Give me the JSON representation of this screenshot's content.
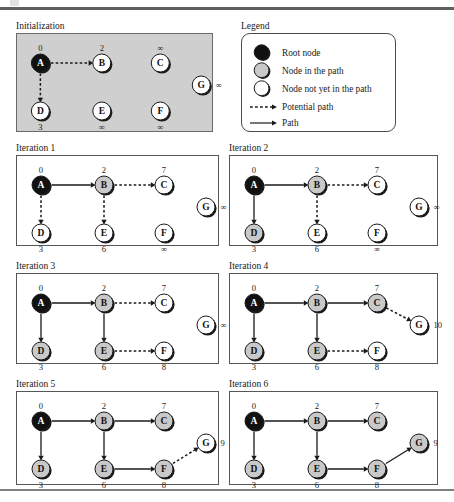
{
  "figure": {
    "corner_mark": "page-corner-artifact",
    "colors": {
      "root_node_fill": "#111111",
      "in_path_node_fill": "#c9c9c9",
      "not_in_path_node_fill": "#ffffff",
      "node_stroke": "#1a1a1a",
      "node_shadow": "#1a1a1a",
      "edge": "#1a1a1a",
      "panel_border": "#565656",
      "init_panel_fill": "#cfcfcf",
      "rule": "#5d5f61"
    }
  },
  "legend": {
    "title": "Legend",
    "items": [
      {
        "kind": "node",
        "style": "root",
        "label": "Root node"
      },
      {
        "kind": "node",
        "style": "in-path",
        "label": "Node in the path"
      },
      {
        "kind": "node",
        "style": "not-in-path",
        "label": "Node not yet in the path"
      },
      {
        "kind": "edge",
        "style": "dashed",
        "label": "Potential path"
      },
      {
        "kind": "edge",
        "style": "solid",
        "label": "Path"
      }
    ]
  },
  "chart_data": {
    "type": "diagram",
    "node_positions": {
      "A": {
        "x": 25,
        "y": 30
      },
      "B": {
        "x": 88,
        "y": 30
      },
      "C": {
        "x": 148,
        "y": 30
      },
      "G": {
        "x": 190,
        "y": 52
      },
      "D": {
        "x": 25,
        "y": 78
      },
      "E": {
        "x": 88,
        "y": 78
      },
      "F": {
        "x": 148,
        "y": 78
      }
    },
    "panels": [
      {
        "id": "initialization",
        "title": "Initialization",
        "shaded": true,
        "nodes": [
          {
            "id": "A",
            "label": "A",
            "state": "root",
            "dist": "0",
            "dist_pos": "above"
          },
          {
            "id": "B",
            "label": "B",
            "state": "not-in-path",
            "dist": "2",
            "dist_pos": "above"
          },
          {
            "id": "C",
            "label": "C",
            "state": "not-in-path",
            "dist": "∞",
            "dist_pos": "above"
          },
          {
            "id": "G",
            "label": "G",
            "state": "not-in-path",
            "dist": "∞",
            "dist_pos": "right"
          },
          {
            "id": "D",
            "label": "D",
            "state": "not-in-path",
            "dist": "3",
            "dist_pos": "below"
          },
          {
            "id": "E",
            "label": "E",
            "state": "not-in-path",
            "dist": "∞",
            "dist_pos": "below"
          },
          {
            "id": "F",
            "label": "F",
            "state": "not-in-path",
            "dist": "∞",
            "dist_pos": "below"
          }
        ],
        "edges": [
          {
            "from": "A",
            "to": "B",
            "style": "dashed"
          },
          {
            "from": "A",
            "to": "D",
            "style": "dashed"
          }
        ]
      },
      {
        "id": "iteration-1",
        "title": "Iteration 1",
        "shaded": false,
        "nodes": [
          {
            "id": "A",
            "label": "A",
            "state": "root",
            "dist": "0",
            "dist_pos": "above"
          },
          {
            "id": "B",
            "label": "B",
            "state": "in-path",
            "dist": "2",
            "dist_pos": "above"
          },
          {
            "id": "C",
            "label": "C",
            "state": "not-in-path",
            "dist": "7",
            "dist_pos": "above"
          },
          {
            "id": "G",
            "label": "G",
            "state": "not-in-path",
            "dist": "∞",
            "dist_pos": "right"
          },
          {
            "id": "D",
            "label": "D",
            "state": "not-in-path",
            "dist": "3",
            "dist_pos": "below"
          },
          {
            "id": "E",
            "label": "E",
            "state": "not-in-path",
            "dist": "6",
            "dist_pos": "below"
          },
          {
            "id": "F",
            "label": "F",
            "state": "not-in-path",
            "dist": "∞",
            "dist_pos": "below"
          }
        ],
        "edges": [
          {
            "from": "A",
            "to": "B",
            "style": "solid"
          },
          {
            "from": "A",
            "to": "D",
            "style": "dashed"
          },
          {
            "from": "B",
            "to": "C",
            "style": "dashed"
          },
          {
            "from": "B",
            "to": "E",
            "style": "dashed"
          }
        ]
      },
      {
        "id": "iteration-2",
        "title": "Iteration 2",
        "shaded": false,
        "nodes": [
          {
            "id": "A",
            "label": "A",
            "state": "root",
            "dist": "0",
            "dist_pos": "above"
          },
          {
            "id": "B",
            "label": "B",
            "state": "in-path",
            "dist": "2",
            "dist_pos": "above"
          },
          {
            "id": "C",
            "label": "C",
            "state": "not-in-path",
            "dist": "7",
            "dist_pos": "above"
          },
          {
            "id": "G",
            "label": "G",
            "state": "not-in-path",
            "dist": "∞",
            "dist_pos": "right"
          },
          {
            "id": "D",
            "label": "D",
            "state": "in-path",
            "dist": "3",
            "dist_pos": "below"
          },
          {
            "id": "E",
            "label": "E",
            "state": "not-in-path",
            "dist": "6",
            "dist_pos": "below"
          },
          {
            "id": "F",
            "label": "F",
            "state": "not-in-path",
            "dist": "∞",
            "dist_pos": "below"
          }
        ],
        "edges": [
          {
            "from": "A",
            "to": "B",
            "style": "solid"
          },
          {
            "from": "A",
            "to": "D",
            "style": "solid"
          },
          {
            "from": "B",
            "to": "C",
            "style": "dashed"
          },
          {
            "from": "B",
            "to": "E",
            "style": "dashed"
          }
        ]
      },
      {
        "id": "iteration-3",
        "title": "Iteration 3",
        "shaded": false,
        "nodes": [
          {
            "id": "A",
            "label": "A",
            "state": "root",
            "dist": "0",
            "dist_pos": "above"
          },
          {
            "id": "B",
            "label": "B",
            "state": "in-path",
            "dist": "2",
            "dist_pos": "above"
          },
          {
            "id": "C",
            "label": "C",
            "state": "not-in-path",
            "dist": "7",
            "dist_pos": "above"
          },
          {
            "id": "G",
            "label": "G",
            "state": "not-in-path",
            "dist": "∞",
            "dist_pos": "right"
          },
          {
            "id": "D",
            "label": "D",
            "state": "in-path",
            "dist": "3",
            "dist_pos": "below"
          },
          {
            "id": "E",
            "label": "E",
            "state": "in-path",
            "dist": "6",
            "dist_pos": "below"
          },
          {
            "id": "F",
            "label": "F",
            "state": "not-in-path",
            "dist": "8",
            "dist_pos": "below"
          }
        ],
        "edges": [
          {
            "from": "A",
            "to": "B",
            "style": "solid"
          },
          {
            "from": "A",
            "to": "D",
            "style": "solid"
          },
          {
            "from": "B",
            "to": "C",
            "style": "dashed"
          },
          {
            "from": "B",
            "to": "E",
            "style": "solid"
          },
          {
            "from": "E",
            "to": "F",
            "style": "dashed"
          }
        ]
      },
      {
        "id": "iteration-4",
        "title": "Iteration 4",
        "shaded": false,
        "nodes": [
          {
            "id": "A",
            "label": "A",
            "state": "root",
            "dist": "0",
            "dist_pos": "above"
          },
          {
            "id": "B",
            "label": "B",
            "state": "in-path",
            "dist": "2",
            "dist_pos": "above"
          },
          {
            "id": "C",
            "label": "C",
            "state": "in-path",
            "dist": "7",
            "dist_pos": "above"
          },
          {
            "id": "G",
            "label": "G",
            "state": "not-in-path",
            "dist": "10",
            "dist_pos": "right"
          },
          {
            "id": "D",
            "label": "D",
            "state": "in-path",
            "dist": "3",
            "dist_pos": "below"
          },
          {
            "id": "E",
            "label": "E",
            "state": "in-path",
            "dist": "6",
            "dist_pos": "below"
          },
          {
            "id": "F",
            "label": "F",
            "state": "not-in-path",
            "dist": "8",
            "dist_pos": "below"
          }
        ],
        "edges": [
          {
            "from": "A",
            "to": "B",
            "style": "solid"
          },
          {
            "from": "A",
            "to": "D",
            "style": "solid"
          },
          {
            "from": "B",
            "to": "C",
            "style": "solid"
          },
          {
            "from": "B",
            "to": "E",
            "style": "solid"
          },
          {
            "from": "E",
            "to": "F",
            "style": "dashed"
          },
          {
            "from": "C",
            "to": "G",
            "style": "dashed"
          }
        ]
      },
      {
        "id": "iteration-5",
        "title": "Iteration 5",
        "shaded": false,
        "nodes": [
          {
            "id": "A",
            "label": "A",
            "state": "root",
            "dist": "0",
            "dist_pos": "above"
          },
          {
            "id": "B",
            "label": "B",
            "state": "in-path",
            "dist": "2",
            "dist_pos": "above"
          },
          {
            "id": "C",
            "label": "C",
            "state": "in-path",
            "dist": "7",
            "dist_pos": "above"
          },
          {
            "id": "G",
            "label": "G",
            "state": "not-in-path",
            "dist": "9",
            "dist_pos": "right"
          },
          {
            "id": "D",
            "label": "D",
            "state": "in-path",
            "dist": "3",
            "dist_pos": "below"
          },
          {
            "id": "E",
            "label": "E",
            "state": "in-path",
            "dist": "6",
            "dist_pos": "below"
          },
          {
            "id": "F",
            "label": "F",
            "state": "in-path",
            "dist": "8",
            "dist_pos": "below"
          }
        ],
        "edges": [
          {
            "from": "A",
            "to": "B",
            "style": "solid"
          },
          {
            "from": "A",
            "to": "D",
            "style": "solid"
          },
          {
            "from": "B",
            "to": "C",
            "style": "solid"
          },
          {
            "from": "B",
            "to": "E",
            "style": "solid"
          },
          {
            "from": "E",
            "to": "F",
            "style": "solid"
          },
          {
            "from": "F",
            "to": "G",
            "style": "dashed"
          }
        ]
      },
      {
        "id": "iteration-6",
        "title": "Iteration 6",
        "shaded": false,
        "nodes": [
          {
            "id": "A",
            "label": "A",
            "state": "root",
            "dist": "0",
            "dist_pos": "above"
          },
          {
            "id": "B",
            "label": "B",
            "state": "in-path",
            "dist": "2",
            "dist_pos": "above"
          },
          {
            "id": "C",
            "label": "C",
            "state": "in-path",
            "dist": "7",
            "dist_pos": "above"
          },
          {
            "id": "G",
            "label": "G",
            "state": "in-path",
            "dist": "9",
            "dist_pos": "right"
          },
          {
            "id": "D",
            "label": "D",
            "state": "in-path",
            "dist": "3",
            "dist_pos": "below"
          },
          {
            "id": "E",
            "label": "E",
            "state": "in-path",
            "dist": "6",
            "dist_pos": "below"
          },
          {
            "id": "F",
            "label": "F",
            "state": "in-path",
            "dist": "8",
            "dist_pos": "below"
          }
        ],
        "edges": [
          {
            "from": "A",
            "to": "B",
            "style": "solid"
          },
          {
            "from": "A",
            "to": "D",
            "style": "solid"
          },
          {
            "from": "B",
            "to": "C",
            "style": "solid"
          },
          {
            "from": "B",
            "to": "E",
            "style": "solid"
          },
          {
            "from": "E",
            "to": "F",
            "style": "solid"
          },
          {
            "from": "F",
            "to": "G",
            "style": "solid"
          }
        ]
      }
    ]
  }
}
